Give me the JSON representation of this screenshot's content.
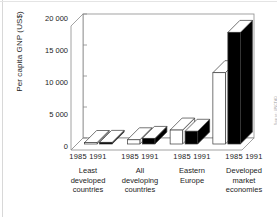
{
  "chart_data": {
    "type": "bar",
    "title": "",
    "subtitle": "",
    "xlabel": "",
    "ylabel": "Per capita GNP (US$)",
    "ylim": [
      0,
      20000
    ],
    "yticks": [
      0,
      5000,
      10000,
      15000,
      20000
    ],
    "ytick_labels": [
      "0",
      "5 000",
      "10 000",
      "15 000",
      "20 000"
    ],
    "grid": false,
    "legend_position": "none",
    "style": "3d-perspective-bars",
    "categories": [
      "Least developed countries",
      "All developing countries",
      "Eastern Europe",
      "Developed market economies"
    ],
    "series": [
      {
        "name": "1985",
        "color": "#ffffff",
        "values": [
          240,
          680,
          2250,
          11500
        ]
      },
      {
        "name": "1991",
        "color": "#000000",
        "values": [
          260,
          900,
          2050,
          18000
        ]
      }
    ],
    "annotation": "Per capita GNP (US$) by country group, 1985 and 1991",
    "credit": "Source: UNCTAD"
  },
  "axis": {
    "y_label": "Per capita GNP (US$)",
    "y_tick_labels": [
      "20 000",
      "15 000",
      "10 000",
      "5 000",
      "0"
    ]
  },
  "groups": [
    {
      "years": "1985 1991",
      "name_lines": [
        "Least",
        "developed",
        "countries"
      ]
    },
    {
      "years": "1985 1991",
      "name_lines": [
        "All",
        "developing",
        "countries"
      ]
    },
    {
      "years": "1985 1991",
      "name_lines": [
        "Eastern",
        "Europe"
      ]
    },
    {
      "years": "1985 1991",
      "name_lines": [
        "Developed",
        "market",
        "economies"
      ]
    }
  ],
  "credit": "Source: UNCTAD",
  "colors": {
    "bar_1985": "#ffffff",
    "bar_1991": "#000000",
    "outline": "#3a3a3a",
    "frame": "#8c8c8c",
    "text": "#1c1c1c",
    "background": "#ffffff"
  }
}
